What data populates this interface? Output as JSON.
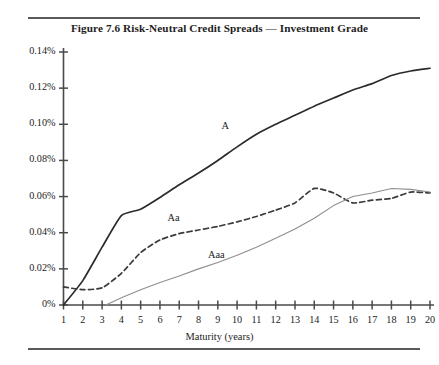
{
  "figure": {
    "caption_number": "Figure 7.6",
    "caption_text": "Risk-Neutral Credit Spreads — Investment Grade",
    "caption_full": "Figure 7.6    Risk-Neutral Credit Spreads — Investment Grade"
  },
  "colors": {
    "series_a": "#2b2b2b",
    "series_aa": "#3a3a3a",
    "series_aaa": "#8e8e8e",
    "axis": "#4a4a4a",
    "rule": "#5a5a5a",
    "text": "#1d1d1d"
  },
  "chart_data": {
    "type": "line",
    "title": "Risk-Neutral Credit Spreads — Investment Grade",
    "xlabel": "Maturity (years)",
    "ylabel": "",
    "grid": false,
    "legend_position": "inline-annotations",
    "xlim": [
      1,
      20
    ],
    "ylim": [
      0,
      0.14
    ],
    "xticks": [
      1,
      2,
      3,
      4,
      5,
      6,
      7,
      8,
      9,
      10,
      11,
      12,
      13,
      14,
      15,
      16,
      17,
      18,
      19,
      20
    ],
    "xtick_labels": [
      "1",
      "2",
      "3",
      "4",
      "5",
      "6",
      "7",
      "8",
      "9",
      "10",
      "11",
      "12",
      "13",
      "14",
      "15",
      "16",
      "17",
      "18",
      "19",
      "20"
    ],
    "yticks": [
      0,
      0.02,
      0.04,
      0.06,
      0.08,
      0.1,
      0.12,
      0.14
    ],
    "ytick_labels": [
      "0%",
      "0.02%",
      "0.04%",
      "0.06%",
      "0.08%",
      "0.10%",
      "0.12%",
      "0.14%"
    ],
    "x": [
      1,
      2,
      3,
      4,
      5,
      6,
      7,
      8,
      9,
      10,
      11,
      12,
      13,
      14,
      15,
      16,
      17,
      18,
      19,
      20
    ],
    "series": [
      {
        "name": "A",
        "style": "solid",
        "color": "#2b2b2b",
        "label_x": 9.6,
        "label_y": 0.0985,
        "values": [
          0.0,
          0.0135,
          0.032,
          0.0495,
          0.053,
          0.0595,
          0.0665,
          0.073,
          0.08,
          0.0875,
          0.0945,
          0.1,
          0.105,
          0.11,
          0.1145,
          0.119,
          0.1225,
          0.127,
          0.1295,
          0.131
        ]
      },
      {
        "name": "Aa",
        "style": "dashed",
        "color": "#3a3a3a",
        "label_x": 6.8,
        "label_y": 0.0475,
        "values": [
          0.01,
          0.0085,
          0.0095,
          0.0175,
          0.029,
          0.036,
          0.0395,
          0.0415,
          0.0435,
          0.046,
          0.049,
          0.0525,
          0.0565,
          0.0645,
          0.062,
          0.0565,
          0.058,
          0.059,
          0.0625,
          0.062
        ]
      },
      {
        "name": "Aaa",
        "style": "solid-light",
        "color": "#8e8e8e",
        "label_x": 8.9,
        "label_y": 0.027,
        "values": [
          0.0,
          0.0,
          0.0,
          0.004,
          0.0085,
          0.0125,
          0.016,
          0.02,
          0.0235,
          0.0275,
          0.032,
          0.037,
          0.042,
          0.048,
          0.055,
          0.06,
          0.062,
          0.0645,
          0.064,
          0.0625
        ]
      }
    ],
    "annotations": [
      {
        "text": "A",
        "x": 9.6,
        "y": 0.0985
      },
      {
        "text": "Aa",
        "x": 6.8,
        "y": 0.0475
      },
      {
        "text": "Aaa",
        "x": 8.9,
        "y": 0.027
      }
    ]
  }
}
